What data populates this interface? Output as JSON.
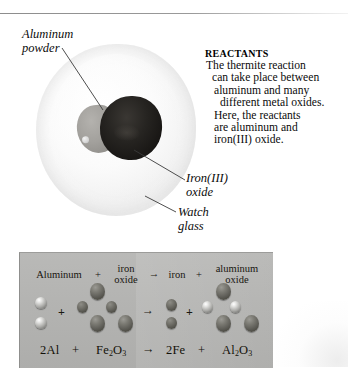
{
  "figure": {
    "title_rule": "top-divider",
    "photo": {
      "name": "thermite-reactants-photograph",
      "subjects": [
        "watch glass",
        "aluminum powder",
        "iron(III) oxide"
      ]
    },
    "labels": {
      "aluminum_powder": "Aluminum\npowder",
      "iron_oxide": "Iron(III)\noxide",
      "watch_glass": "Watch\nglass"
    },
    "reactants": {
      "heading": "REACTANTS",
      "lines": [
        "The thermite reaction",
        "can take place between",
        "aluminum and many",
        "different metal oxides.",
        "Here, the reactants",
        "are aluminum and",
        "iron(III) oxide."
      ]
    },
    "model_panel": {
      "word_equation": {
        "aluminum": "Aluminum",
        "plus_1": "+",
        "iron_oxide": "iron\noxide",
        "arrow_1": "→",
        "iron": "iron",
        "plus_2": "+",
        "aluminum_oxide": "aluminum\noxide"
      },
      "symbol_equation": {
        "reactant_1_coefficient": "2",
        "reactant_1": "Al",
        "plus_1": "+",
        "reactant_2": "Fe",
        "reactant_2_sub_fe": "2",
        "reactant_2_o": "O",
        "reactant_2_sub_o": "3",
        "arrow": "→",
        "product_1_coefficient": "2",
        "product_1": "Fe",
        "plus_2": "+",
        "product_2": "Al",
        "product_2_sub_al": "2",
        "product_2_o": "O",
        "product_2_sub_o": "3",
        "full_text": "2Al + Fe2O3 → 2Fe + Al2O3"
      },
      "operators": {
        "plus_reactants": "+",
        "arrow": "→",
        "plus_products": "+"
      }
    },
    "colors": {
      "panel_background": "#b4b4b2",
      "aluminum_atom": "#c9c9c6",
      "iron_atom": "#5d5c56",
      "oxygen_atom": "#57564f",
      "iron_oxide_pile": "#201e1b",
      "aluminum_pile": "#a3a19d",
      "leader_line": "#3a3a3a"
    }
  }
}
